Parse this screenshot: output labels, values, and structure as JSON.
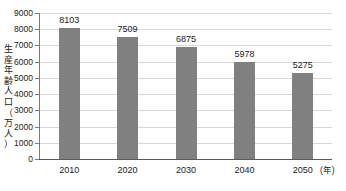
{
  "chart_data": {
    "type": "bar",
    "title": "",
    "subtitle": "",
    "xlabel": "年",
    "ylabel": "生産年齢人口（万人）",
    "categories": [
      "2010",
      "2020",
      "2030",
      "2040",
      "2050"
    ],
    "values": [
      8103,
      7509,
      6875,
      5978,
      5275
    ],
    "series": [
      {
        "name": "生産年齢人口",
        "values": [
          8103,
          7509,
          6875,
          5978,
          5275
        ]
      }
    ],
    "data_labels": [
      "8103",
      "7509",
      "6875",
      "5978",
      "5275"
    ],
    "ylim": [
      0,
      9000
    ],
    "ytick_step": 1000,
    "yticks": [
      9000,
      8000,
      7000,
      6000,
      5000,
      4000,
      3000,
      2000,
      1000,
      0
    ],
    "ytick_labels": [
      "9000",
      "8000",
      "7000",
      "6000",
      "5000",
      "4000",
      "3000",
      "2000",
      "1000",
      "0"
    ],
    "x_unit_label": "(年)",
    "grid": true,
    "grid_axis": "y",
    "legend": false,
    "legend_position": "none",
    "colors": {
      "bar": "#808080",
      "gridline": "#d8d8d8",
      "axis": "#5a5a5a",
      "text": "#1a1a1a",
      "background": "#ffffff"
    }
  },
  "y_axis_title_vertical": "生\n産\n年\n齢\n人\n口\n（\n万\n人\n）"
}
